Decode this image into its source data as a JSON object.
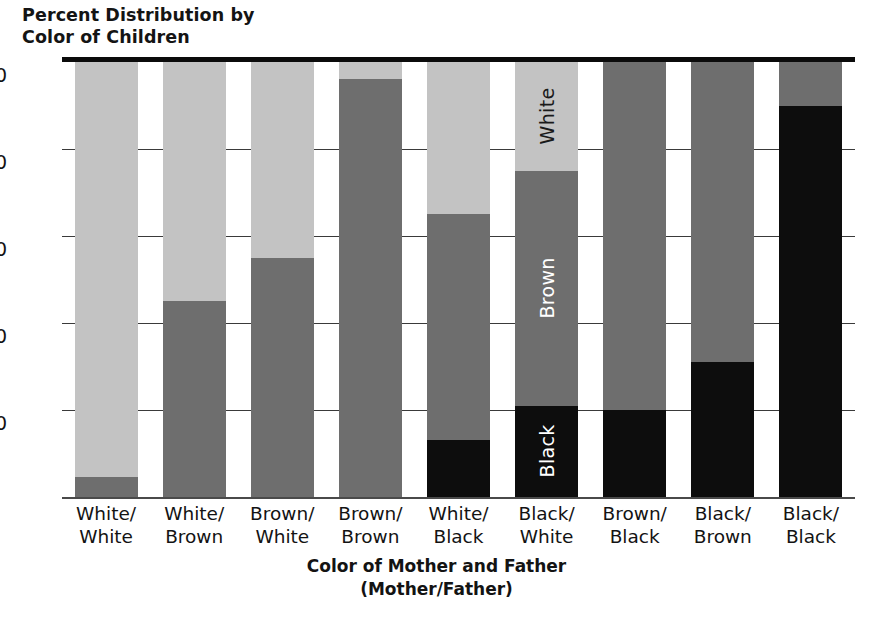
{
  "chart_data": {
    "type": "bar",
    "subtype": "stacked-bar-100",
    "title": "Percent Distribution by\nColor of Children",
    "xlabel": "Color of Mother and Father\n(Mother/Father)",
    "ylabel": "",
    "ylim": [
      0,
      100
    ],
    "yticks": [
      20,
      40,
      60,
      80,
      100
    ],
    "ytick_labels": [
      "20",
      "40",
      "60",
      "80",
      "100"
    ],
    "grid": true,
    "legend": "in-bar labels on Black/White column",
    "categories": [
      "White/\nWhite",
      "White/\nBrown",
      "Brown/\nWhite",
      "Brown/\nBrown",
      "White/\nBlack",
      "Black/\nWhite",
      "Brown/\nBlack",
      "Black/\nBrown",
      "Black/\nBlack"
    ],
    "series": [
      {
        "name": "White",
        "color": "#c3c3c3",
        "values": [
          95.5,
          55.0,
          45.0,
          4.0,
          35.0,
          25.0,
          0.0,
          0.0,
          0.0
        ]
      },
      {
        "name": "Brown",
        "color": "#6e6e6e",
        "values": [
          4.5,
          45.0,
          55.0,
          96.0,
          52.0,
          54.0,
          80.0,
          69.0,
          10.0
        ]
      },
      {
        "name": "Black",
        "color": "#0d0d0d",
        "values": [
          0.0,
          0.0,
          0.0,
          0.0,
          13.0,
          21.0,
          20.0,
          31.0,
          90.0
        ]
      }
    ],
    "in_bar_labels": {
      "bar": "Black/\nWhite",
      "white": "White",
      "brown": "Brown",
      "black": "Black"
    }
  },
  "axis": {
    "y_unit": "percent"
  }
}
